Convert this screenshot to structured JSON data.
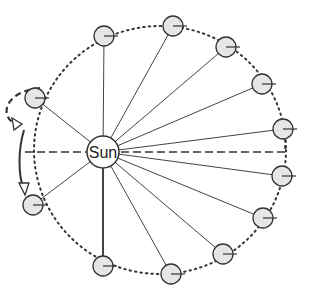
{
  "diagram": {
    "sun": {
      "label": "Sun",
      "cx": 103,
      "cy": 152,
      "r": 16
    },
    "orbit": {
      "cx": 160,
      "cy": 150,
      "rx": 126,
      "ry": 124
    },
    "planets": [
      {
        "cx": 104,
        "cy": 36
      },
      {
        "cx": 173,
        "cy": 26
      },
      {
        "cx": 226,
        "cy": 47
      },
      {
        "cx": 262,
        "cy": 84
      },
      {
        "cx": 283,
        "cy": 129
      },
      {
        "cx": 282,
        "cy": 176
      },
      {
        "cx": 263,
        "cy": 218
      },
      {
        "cx": 223,
        "cy": 254
      },
      {
        "cx": 171,
        "cy": 274
      },
      {
        "cx": 103,
        "cy": 266
      },
      {
        "cx": 33,
        "cy": 205
      },
      {
        "cx": 35,
        "cy": 98
      }
    ],
    "colors": {
      "line": "#444444",
      "planet_fill": "#e6e6e6",
      "stroke": "#333333"
    }
  }
}
